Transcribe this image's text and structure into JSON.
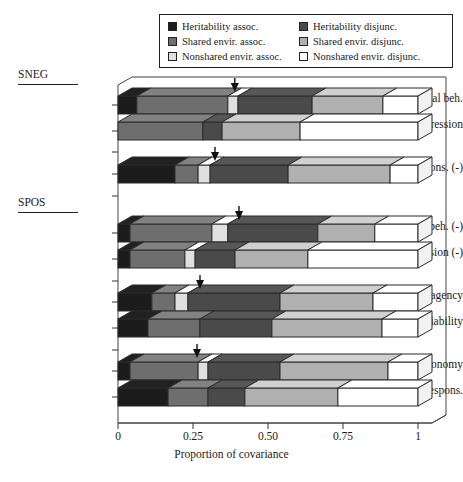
{
  "legend": {
    "items": [
      {
        "label": "Heritability assoc.",
        "color": "#1c1c1c",
        "key": "her_assoc"
      },
      {
        "label": "Heritability disjunc.",
        "color": "#4a4a4a",
        "key": "her_disj"
      },
      {
        "label": "Shared envir. assoc.",
        "color": "#6e6e6e",
        "key": "shr_assoc"
      },
      {
        "label": "Shared envir. disjunc.",
        "color": "#b0b0b0",
        "key": "shr_disj"
      },
      {
        "label": "Nonshared envir. assoc.",
        "color": "#e0e0e0",
        "key": "non_assoc"
      },
      {
        "label": "Nonshared envir. disjunc.",
        "color": "#ffffff",
        "key": "non_disj"
      }
    ],
    "order": [
      0,
      1,
      2,
      3,
      4,
      5
    ]
  },
  "groups": [
    {
      "name": "SNEG",
      "label": "SNEG"
    },
    {
      "name": "SPOS",
      "label": "SPOS"
    }
  ],
  "axis": {
    "ticks": [
      "0",
      "0.25",
      "0.50",
      "0.75",
      "1"
    ],
    "tick_values": [
      0,
      0.25,
      0.5,
      0.75,
      1
    ],
    "title": "Proportion of covariance",
    "min": 0,
    "max": 1
  },
  "chart_data": {
    "type": "bar",
    "orientation": "horizontal",
    "stacked": true,
    "title": "",
    "xlabel": "Proportion of covariance",
    "ylabel": "",
    "xlim": [
      0,
      1
    ],
    "grid": false,
    "legend_position": "top",
    "series": [
      {
        "name": "Heritability assoc.",
        "color": "#1c1c1c"
      },
      {
        "name": "Shared envir. assoc.",
        "color": "#6e6e6e"
      },
      {
        "name": "Nonshared envir. assoc.",
        "color": "#e0e0e0"
      },
      {
        "name": "Heritability disjunc.",
        "color": "#4a4a4a"
      },
      {
        "name": "Shared envir. disjunc.",
        "color": "#b0b0b0"
      },
      {
        "name": "Nonshared envir. disjunc.",
        "color": "#ffffff"
      }
    ],
    "categories": [
      "Antisocial beh.",
      "Depression",
      "Social respons. (-)",
      "Antisocial beh. (-)",
      "Depression (-)",
      "Cog. agency",
      "Sociability",
      "Autonomy",
      "Social respons."
    ],
    "bars": [
      {
        "label": "Antisocial beh.",
        "group": "SNEG",
        "y": 96,
        "marker": 0.366,
        "values": [
          0.063,
          0.303,
          0.034,
          0.247,
          0.236,
          0.117
        ]
      },
      {
        "label": "Depression",
        "group": "SNEG",
        "y": 122,
        "marker": null,
        "values": [
          0.0,
          0.283,
          0.0,
          0.064,
          0.26,
          0.393
        ]
      },
      {
        "label": "Social respons. (-)",
        "group": "SNEG",
        "y": 165,
        "marker": 0.3,
        "values": [
          0.19,
          0.077,
          0.04,
          0.26,
          0.34,
          0.093
        ]
      },
      {
        "label": "Antisocial beh. (-)",
        "group": "SPOS",
        "y": 224,
        "marker": 0.38,
        "values": [
          0.04,
          0.273,
          0.053,
          0.3,
          0.19,
          0.144
        ]
      },
      {
        "label": "Depression (-)",
        "group": "SPOS",
        "y": 250,
        "marker": null,
        "values": [
          0.04,
          0.183,
          0.034,
          0.133,
          0.243,
          0.367
        ]
      },
      {
        "label": "Cog. agency",
        "group": "SPOS",
        "y": 293,
        "marker": 0.25,
        "values": [
          0.113,
          0.077,
          0.043,
          0.307,
          0.31,
          0.15
        ]
      },
      {
        "label": "Sociability",
        "group": "SPOS",
        "y": 319,
        "marker": null,
        "values": [
          0.1,
          0.173,
          0.0,
          0.24,
          0.367,
          0.12
        ]
      },
      {
        "label": "Autonomy",
        "group": "SPOS",
        "y": 362,
        "marker": 0.24,
        "values": [
          0.04,
          0.227,
          0.033,
          0.24,
          0.36,
          0.1
        ]
      },
      {
        "label": "Social respons.",
        "group": "SPOS",
        "y": 388,
        "marker": null,
        "values": [
          0.167,
          0.133,
          0.0,
          0.123,
          0.31,
          0.267
        ]
      }
    ]
  },
  "layout": {
    "x0": 118,
    "x1": 418,
    "bar_height": 18,
    "depth_x": 14,
    "depth_y": 8,
    "group_labels": [
      {
        "text": "SNEG",
        "x": 18,
        "y": 74,
        "rule_x": 18,
        "rule_y": 89,
        "rule_w": 60
      },
      {
        "text": "SPOS",
        "x": 18,
        "y": 202,
        "rule_x": 18,
        "rule_y": 217,
        "rule_w": 60
      }
    ]
  }
}
